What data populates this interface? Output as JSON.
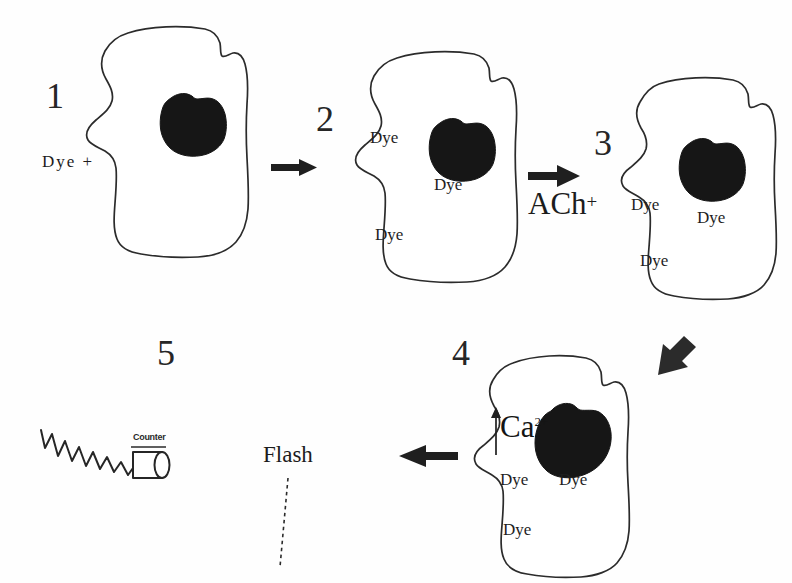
{
  "figure": {
    "type": "biological-process-diagram",
    "background_color": "#fefefe",
    "ink_color": "#1c1c1c"
  },
  "steps": [
    {
      "number": "1",
      "name": "cell-dye-outside",
      "cell_labels": [],
      "external_label": "Dye  +"
    },
    {
      "number": "2",
      "name": "cell-dye-loaded",
      "cell_labels": [
        "Dye",
        "Dye",
        "Dye"
      ],
      "external_label": ""
    },
    {
      "number": "3",
      "name": "cell-ach-stimulated",
      "cell_labels": [
        "Dye",
        "Dye",
        "Dye"
      ],
      "external_label": "ACh",
      "external_label_sup": "+"
    },
    {
      "number": "4",
      "name": "cell-calcium-influx",
      "cell_labels": [
        "Dye",
        "Dye",
        "Dye"
      ],
      "ion_label": "Ca",
      "ion_charge": "2+"
    },
    {
      "number": "5",
      "name": "photon-counter",
      "counter_label": "Counter",
      "flash_label": "Flash"
    }
  ],
  "arrows": [
    {
      "name": "arrow-step1-to-step2",
      "direction": "right"
    },
    {
      "name": "arrow-step2-to-step3",
      "direction": "right"
    },
    {
      "name": "arrow-step3-to-step4",
      "direction": "down-left-diagonal"
    },
    {
      "name": "arrow-step4-to-step5",
      "direction": "left"
    },
    {
      "name": "arrow-calcium-influx",
      "direction": "up"
    }
  ]
}
